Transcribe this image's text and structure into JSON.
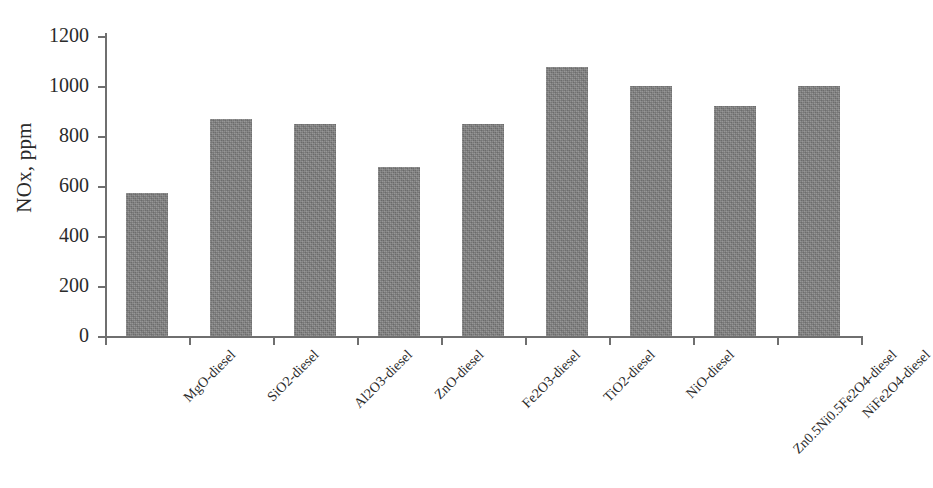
{
  "chart_data": {
    "type": "bar",
    "title": "",
    "subtitle": "",
    "xlabel": "",
    "ylabel": "NOx, ppm",
    "ylim": [
      0,
      1200
    ],
    "ytick_step": 200,
    "yticks": [
      0,
      200,
      400,
      600,
      800,
      1000,
      1200
    ],
    "ytick_labels": [
      "0",
      "200",
      "400",
      "600",
      "800",
      "1000",
      "1200"
    ],
    "grid": false,
    "legend": false,
    "legend_position": "none",
    "bar_color": "#7d7d7d",
    "categories": [
      "MgO-diesel",
      "SiO2-diesel",
      "Al2O3-diesel",
      "ZnO-diesel",
      "Fe2O3-diesel",
      "TiO2-diesel",
      "NiO-diesel",
      "Zn0.5Ni0.5Fe2O4-diesel",
      "NiFe2O4-diesel"
    ],
    "values": [
      572,
      868,
      850,
      678,
      850,
      1075,
      1000,
      920,
      1000
    ],
    "series": [
      {
        "name": "NOx, ppm",
        "values": [
          572,
          868,
          850,
          678,
          850,
          1075,
          1000,
          920,
          1000
        ]
      }
    ]
  },
  "axes": {
    "y_title": "NOx, ppm"
  }
}
